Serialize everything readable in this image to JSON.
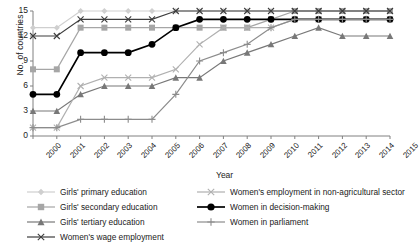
{
  "chart_data": {
    "type": "line",
    "title": "",
    "xlabel": "Year",
    "ylabel": "No. of countries",
    "ylim": [
      0,
      15
    ],
    "yticks": [
      0,
      3,
      6,
      9,
      12,
      15
    ],
    "grid": false,
    "legend_position": "bottom",
    "categories": [
      "2000",
      "2001",
      "2002",
      "2003",
      "2004",
      "2005",
      "2006",
      "2007",
      "2008",
      "2009",
      "2010",
      "2011",
      "2012",
      "2013",
      "2014",
      "2015"
    ],
    "series": [
      {
        "name": "Girls' primary education",
        "color": "#cfcfcf",
        "marker": "diamond",
        "values": [
          13,
          13,
          15,
          15,
          15,
          15,
          15,
          15,
          15,
          15,
          15,
          15,
          15,
          15,
          15,
          15
        ]
      },
      {
        "name": "Girls' secondary education",
        "color": "#a6a6a6",
        "marker": "square",
        "values": [
          8,
          8,
          13,
          13,
          13,
          13,
          13,
          13,
          13,
          13,
          14,
          15,
          15,
          15,
          15,
          15
        ]
      },
      {
        "name": "Girls' tertiary education",
        "color": "#787878",
        "marker": "triangle",
        "values": [
          3,
          3,
          5,
          6,
          6,
          6,
          7,
          7,
          9,
          10,
          11,
          12,
          13,
          12,
          12,
          12
        ]
      },
      {
        "name": "Women's wage employment",
        "color": "#3d3d3d",
        "marker": "cross",
        "values": [
          12,
          12,
          14,
          14,
          14,
          14,
          15,
          15,
          15,
          15,
          15,
          15,
          15,
          15,
          15,
          15
        ]
      },
      {
        "name": "Women's employment in non-agricultural sector",
        "color": "#b0b0b0",
        "marker": "cross",
        "values": [
          1,
          1,
          6,
          7,
          7,
          7,
          8,
          11,
          13,
          13,
          13,
          14,
          14,
          14,
          14,
          14
        ]
      },
      {
        "name": "Women in decision-making",
        "color": "#000000",
        "marker": "circle",
        "values": [
          5,
          5,
          10,
          10,
          10,
          11,
          13,
          14,
          14,
          14,
          14,
          14,
          14,
          14,
          14,
          14
        ]
      },
      {
        "name": "Women in parliament",
        "color": "#8c8c8c",
        "marker": "plus",
        "values": [
          1,
          1,
          2,
          2,
          2,
          2,
          5,
          9,
          10,
          11,
          13,
          14,
          14,
          14,
          14,
          14
        ]
      }
    ]
  },
  "axis": {
    "y_title": "No. of countries",
    "x_title": "Year",
    "y_ticks": [
      "0",
      "3",
      "6",
      "9",
      "12",
      "15"
    ],
    "x_ticks": [
      "2000",
      "2001",
      "2002",
      "2003",
      "2004",
      "2005",
      "2006",
      "2007",
      "2008",
      "2009",
      "2010",
      "2011",
      "2012",
      "2013",
      "2014",
      "2015"
    ]
  },
  "legend": {
    "left_items": [
      "Girls' primary education",
      "Girls' secondary education",
      "Girls' tertiary education",
      "Women's wage employment"
    ],
    "right_items": [
      "Women's employment in non-agricultural sector",
      "Women in decision-making",
      "Women in parliament"
    ]
  }
}
